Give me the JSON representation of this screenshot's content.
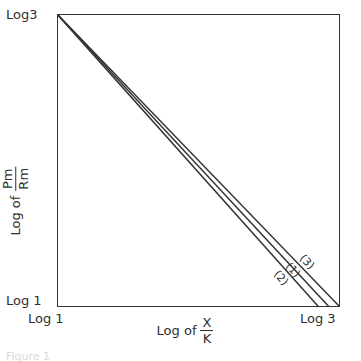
{
  "figure": {
    "caption": "Figure 1"
  },
  "axes": {
    "y": {
      "title_prefix": "Log of",
      "title_numerator": "Pm",
      "title_denominator": "Rm",
      "tick_top": "Log3",
      "tick_bottom": "Log 1"
    },
    "x": {
      "title_prefix": "Log of",
      "title_numerator": "X",
      "title_denominator": "K",
      "tick_left": "Log 1",
      "tick_right": "Log 3"
    }
  },
  "chart_data": {
    "type": "line",
    "title": "",
    "xlabel": "Log of X/K",
    "ylabel": "Log of Pm/Rm",
    "xlim": [
      0,
      1
    ],
    "ylim": [
      0,
      1
    ],
    "xticks": [
      0,
      1
    ],
    "xticklabels": [
      "Log 1",
      "Log 3"
    ],
    "yticks": [
      0,
      1
    ],
    "yticklabels": [
      "Log 1",
      "Log3"
    ],
    "grid": false,
    "legend": "inline-curve-labels",
    "note": "Three straight descending lines all originating at the top-left corner (Log 1, Log3) and fanning out slightly toward the lower-right corner (Log 3, Log 1). Order at the right end from top to bottom: (3), (1), (2).",
    "series": [
      {
        "name": "(3)",
        "label": "(3)",
        "color": "#333333",
        "x": [
          0,
          1
        ],
        "y": [
          1,
          0
        ],
        "label_position": {
          "x": 0.885,
          "y": 0.155
        },
        "label_rotation_deg": 46
      },
      {
        "name": "(1)",
        "label": "(1)",
        "color": "#333333",
        "x": [
          0,
          0.962
        ],
        "y": [
          1,
          0
        ],
        "label_position": {
          "x": 0.835,
          "y": 0.125
        },
        "label_rotation_deg": 47
      },
      {
        "name": "(2)",
        "label": "(2)",
        "color": "#333333",
        "x": [
          0,
          0.925
        ],
        "y": [
          1,
          0
        ],
        "label_position": {
          "x": 0.79,
          "y": 0.1
        },
        "label_rotation_deg": 48
      }
    ]
  }
}
